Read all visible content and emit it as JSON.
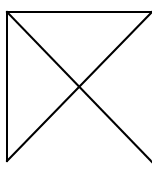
{
  "diagram": {
    "title": "",
    "background": "#ffffff",
    "stroke_color": "#000000",
    "stroke_width": 2,
    "lines": [
      {
        "id": "top-edge",
        "x1": 7,
        "y1": 12,
        "x2": 152,
        "y2": 12
      },
      {
        "id": "left-edge",
        "x1": 7,
        "y1": 12,
        "x2": 7,
        "y2": 161
      },
      {
        "id": "diagonal-tl-br",
        "x1": 7,
        "y1": 12,
        "x2": 152,
        "y2": 162
      },
      {
        "id": "diagonal-bl-tr",
        "x1": 7,
        "y1": 161,
        "x2": 152,
        "y2": 12
      }
    ],
    "intersection": {
      "x": 80,
      "y": 87
    }
  }
}
